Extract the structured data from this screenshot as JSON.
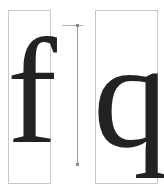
{
  "diagram": {
    "glyphs": [
      {
        "char": "f",
        "box": {
          "x": 8,
          "y": 10,
          "w": 43,
          "h": 174
        }
      },
      {
        "char": "q",
        "box": {
          "x": 95,
          "y": 10,
          "w": 63,
          "h": 174
        }
      }
    ],
    "measure_line": {
      "x": 77,
      "y_top": 25,
      "y_bottom": 165,
      "orientation": "vertical"
    },
    "colors": {
      "glyph": "#222222",
      "box_border": "#c8c8c8",
      "measure_line": "#9a9a9a",
      "background": "#ffffff"
    }
  }
}
